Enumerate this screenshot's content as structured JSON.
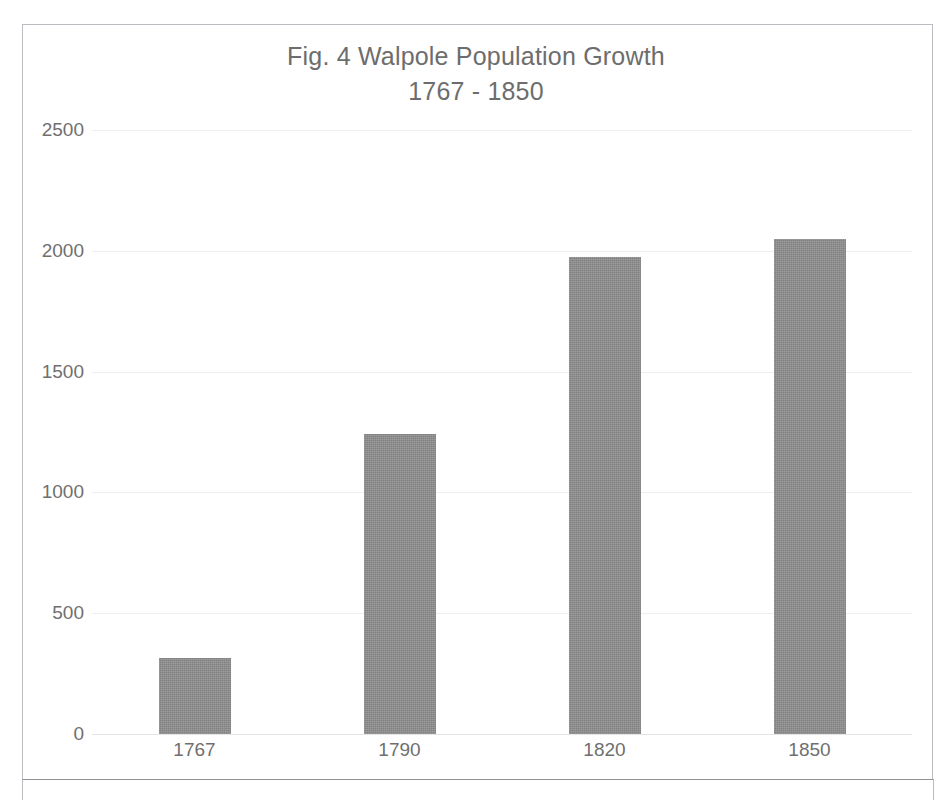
{
  "chart_data": {
    "type": "bar",
    "title": "Fig. 4 Walpole Population Growth",
    "subtitle": "1767 - 1850",
    "title_lines": [
      "Fig. 4 Walpole Population Growth",
      "1767 - 1850"
    ],
    "categories": [
      "1767",
      "1790",
      "1820",
      "1850"
    ],
    "values": [
      315,
      1240,
      1975,
      2050
    ],
    "series": [
      {
        "name": "Population",
        "values": [
          315,
          1240,
          1975,
          2050
        ]
      }
    ],
    "xlabel": "",
    "ylabel": "",
    "ylim": [
      0,
      2500
    ],
    "yticks": [
      0,
      500,
      1000,
      1500,
      2000,
      2500
    ],
    "ytick_labels": [
      "0",
      "500",
      "1000",
      "1500",
      "2000",
      "2500"
    ],
    "grid": true,
    "grid_axis": "y",
    "legend": false,
    "legend_position": "none",
    "bar_color": "#8e8e8e",
    "gridline_color": "#eceff1",
    "text_color": "#6f6f6f",
    "background_color": "#ffffff",
    "annotations": []
  },
  "page": {
    "frame_color": "#b9bcc0"
  }
}
